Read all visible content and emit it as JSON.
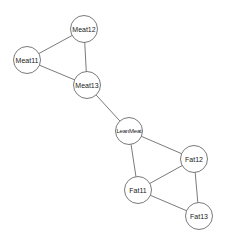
{
  "graph": {
    "type": "undirected-network",
    "nodes": [
      {
        "id": "Meat12",
        "label": "Meat12"
      },
      {
        "id": "Meat11",
        "label": "Meat11"
      },
      {
        "id": "Meat13",
        "label": "Meat13"
      },
      {
        "id": "LeanMeat",
        "label": "LeanMeat"
      },
      {
        "id": "Fat12",
        "label": "Fat12"
      },
      {
        "id": "Fat11",
        "label": "Fat11"
      },
      {
        "id": "Fat13",
        "label": "Fat13"
      }
    ],
    "edges": [
      {
        "source": "Meat11",
        "target": "Meat12"
      },
      {
        "source": "Meat11",
        "target": "Meat13"
      },
      {
        "source": "Meat12",
        "target": "Meat13"
      },
      {
        "source": "Meat13",
        "target": "LeanMeat"
      },
      {
        "source": "LeanMeat",
        "target": "Fat12"
      },
      {
        "source": "LeanMeat",
        "target": "Fat11"
      },
      {
        "source": "Fat11",
        "target": "Fat12"
      },
      {
        "source": "Fat11",
        "target": "Fat13"
      },
      {
        "source": "Fat12",
        "target": "Fat13"
      }
    ],
    "colors": {
      "edge": "#6b6b6b",
      "node_fill": "#ffffff",
      "node_stroke": "#6b6b6b",
      "label": "#222222"
    }
  }
}
